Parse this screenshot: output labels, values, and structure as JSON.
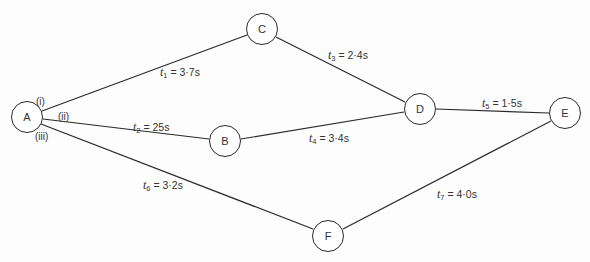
{
  "diagram": {
    "type": "network-activity-diagram",
    "nodes": [
      {
        "id": "A",
        "label": "A",
        "x": 27,
        "y": 117
      },
      {
        "id": "B",
        "label": "B",
        "x": 225,
        "y": 141
      },
      {
        "id": "C",
        "label": "C",
        "x": 262,
        "y": 29
      },
      {
        "id": "D",
        "label": "D",
        "x": 420,
        "y": 109
      },
      {
        "id": "E",
        "label": "E",
        "x": 565,
        "y": 113
      },
      {
        "id": "F",
        "label": "F",
        "x": 328,
        "y": 236
      }
    ],
    "edges": [
      {
        "from": "A",
        "to": "C",
        "var": "t",
        "sub": "1",
        "value": "= 3·7s"
      },
      {
        "from": "A",
        "to": "B",
        "var": "t",
        "sub": "2",
        "value": "= 25s"
      },
      {
        "from": "C",
        "to": "D",
        "var": "t",
        "sub": "3",
        "value": "= 2·4s"
      },
      {
        "from": "B",
        "to": "D",
        "var": "t",
        "sub": "4",
        "value": "= 3·4s"
      },
      {
        "from": "D",
        "to": "E",
        "var": "t",
        "sub": "5",
        "value": "= 1·5s"
      },
      {
        "from": "A",
        "to": "F",
        "var": "t",
        "sub": "6",
        "value": "= 3·2s"
      },
      {
        "from": "F",
        "to": "E",
        "var": "t",
        "sub": "7",
        "value": "= 4·0s"
      }
    ],
    "path_labels": [
      "(i)",
      "(ii)",
      "(iii)"
    ]
  }
}
